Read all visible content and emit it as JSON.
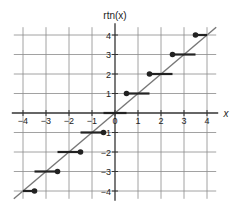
{
  "chart_data": {
    "type": "line",
    "title": "",
    "xlabel": "x",
    "ylabel": "rtn(x)",
    "xlim": [
      -4.4,
      4.4
    ],
    "ylim": [
      -4.4,
      4.4
    ],
    "grid": true,
    "x_ticks": [
      -4,
      -3,
      -2,
      -1,
      0,
      1,
      2,
      3,
      4
    ],
    "y_ticks": [
      -4,
      -3,
      -2,
      -1,
      1,
      2,
      3,
      4
    ],
    "x_tick_labels": [
      "−4",
      "−3",
      "−2",
      "−1",
      "0",
      "1",
      "2",
      "3",
      "4"
    ],
    "y_tick_labels": [
      "−4",
      "−3",
      "−2",
      "−1",
      "1",
      "2",
      "3",
      "4"
    ],
    "series": [
      {
        "name": "y = x",
        "kind": "line",
        "color": "#777777",
        "points": [
          [
            -4.4,
            -4.4
          ],
          [
            4.4,
            4.4
          ]
        ]
      },
      {
        "name": "rtn(x)",
        "kind": "step",
        "color": "#222222",
        "segments": [
          {
            "x_start": -4.0,
            "x_end": -3.5,
            "y": -4,
            "closed_end": "right"
          },
          {
            "x_start": -3.5,
            "x_end": -2.5,
            "y": -3,
            "closed_end": "right"
          },
          {
            "x_start": -2.5,
            "x_end": -1.5,
            "y": -2,
            "closed_end": "right"
          },
          {
            "x_start": -1.5,
            "x_end": -0.5,
            "y": -1,
            "closed_end": "right"
          },
          {
            "x_start": -0.5,
            "x_end": 0.5,
            "y": 0,
            "closed_end": "none"
          },
          {
            "x_start": 0.5,
            "x_end": 1.5,
            "y": 1,
            "closed_end": "left"
          },
          {
            "x_start": 1.5,
            "x_end": 2.5,
            "y": 2,
            "closed_end": "left"
          },
          {
            "x_start": 2.5,
            "x_end": 3.5,
            "y": 3,
            "closed_end": "left"
          },
          {
            "x_start": 3.5,
            "x_end": 4.0,
            "y": 4,
            "closed_end": "left"
          }
        ]
      }
    ]
  },
  "layout": {
    "origin_px": [
      115,
      113
    ],
    "unit_x_px": 23,
    "unit_y_px": 19.5,
    "grid_color": "#8a8a8a",
    "axis_color": "#333333"
  }
}
